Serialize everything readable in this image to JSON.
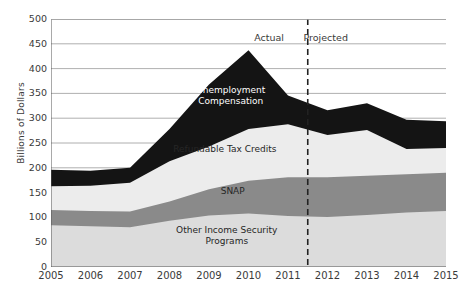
{
  "chart_data": {
    "type": "area",
    "stacked": true,
    "title": "",
    "xlabel": "",
    "ylabel": "Billions of Dollars",
    "ylim": [
      0,
      500
    ],
    "xlim": [
      2005,
      2015
    ],
    "grid": true,
    "legend_position": "inline-labels",
    "x": [
      2005,
      2006,
      2007,
      2008,
      2009,
      2010,
      2011,
      2012,
      2013,
      2014,
      2015
    ],
    "y_ticks": [
      0,
      50,
      100,
      150,
      200,
      250,
      300,
      350,
      400,
      450,
      500
    ],
    "x_ticks": [
      "2005",
      "2006",
      "2007",
      "2008",
      "2009",
      "2010",
      "2011",
      "2012",
      "2013",
      "2014",
      "2015"
    ],
    "series": [
      {
        "name": "Other Income Security Programs",
        "color": "#dcdcdc",
        "values": [
          84,
          82,
          80,
          93,
          104,
          108,
          103,
          101,
          105,
          110,
          113
        ]
      },
      {
        "name": "SNAP",
        "color": "#8a8a8a",
        "values": [
          31,
          31,
          32,
          39,
          53,
          66,
          78,
          80,
          79,
          77,
          77
        ]
      },
      {
        "name": "Refundable Tax Credits",
        "color": "#ececec",
        "values": [
          48,
          51,
          58,
          81,
          86,
          104,
          107,
          85,
          92,
          51,
          50
        ]
      },
      {
        "name": "Unemployment Compensation",
        "color": "#141414",
        "values": [
          33,
          30,
          30,
          65,
          125,
          159,
          58,
          50,
          54,
          59,
          54
        ]
      }
    ],
    "stack_tops": {
      "Other Income Security Programs": [
        84,
        82,
        80,
        93,
        104,
        108,
        103,
        101,
        105,
        110,
        113
      ],
      "SNAP": [
        115,
        113,
        112,
        132,
        157,
        174,
        181,
        181,
        184,
        187,
        190
      ],
      "Refundable Tax Credits": [
        163,
        164,
        170,
        213,
        243,
        278,
        288,
        266,
        276,
        238,
        240
      ],
      "Unemployment Compensation": [
        196,
        194,
        200,
        278,
        368,
        437,
        346,
        316,
        330,
        297,
        294
      ]
    },
    "annotations": [
      {
        "name": "actual-label",
        "text": "Actual",
        "x": 2010.6,
        "y": 462
      },
      {
        "name": "projected-label",
        "text": "Projected",
        "x": 2011.9,
        "y": 462
      }
    ],
    "divider": {
      "name": "actual-projected-divider",
      "x": 2011.5,
      "style": "dashed",
      "color": "#222222"
    },
    "inline_labels": [
      {
        "name": "unemployment-compensation-label",
        "text": "Unemployment\nCompensation",
        "x": 2009.55,
        "y": 355,
        "on": "dark"
      },
      {
        "name": "refundable-tax-credits-label",
        "text": "Refundable Tax Credits",
        "x": 2009.4,
        "y": 236,
        "on": "light"
      },
      {
        "name": "snap-label",
        "text": "SNAP",
        "x": 2009.6,
        "y": 152,
        "on": "light"
      },
      {
        "name": "other-income-security-label",
        "text": "Other Income Security\nPrograms",
        "x": 2009.45,
        "y": 72,
        "on": "light"
      }
    ]
  },
  "axes": {
    "y_title": "Billions of Dollars",
    "y_tick_labels": [
      "500",
      "450",
      "400",
      "350",
      "300",
      "250",
      "200",
      "150",
      "100",
      "50",
      "0"
    ],
    "x_tick_labels": [
      "2005",
      "2006",
      "2007",
      "2008",
      "2009",
      "2010",
      "2011",
      "2012",
      "2013",
      "2014",
      "2015"
    ]
  },
  "colors": {
    "other_income_security": "#dcdcdc",
    "snap": "#8a8a8a",
    "refundable_tax_credits": "#ececec",
    "unemployment_compensation": "#141414",
    "gridline": "#9a9a9a",
    "axis": "#555555",
    "text": "#3a3a3a",
    "divider": "#222222"
  }
}
